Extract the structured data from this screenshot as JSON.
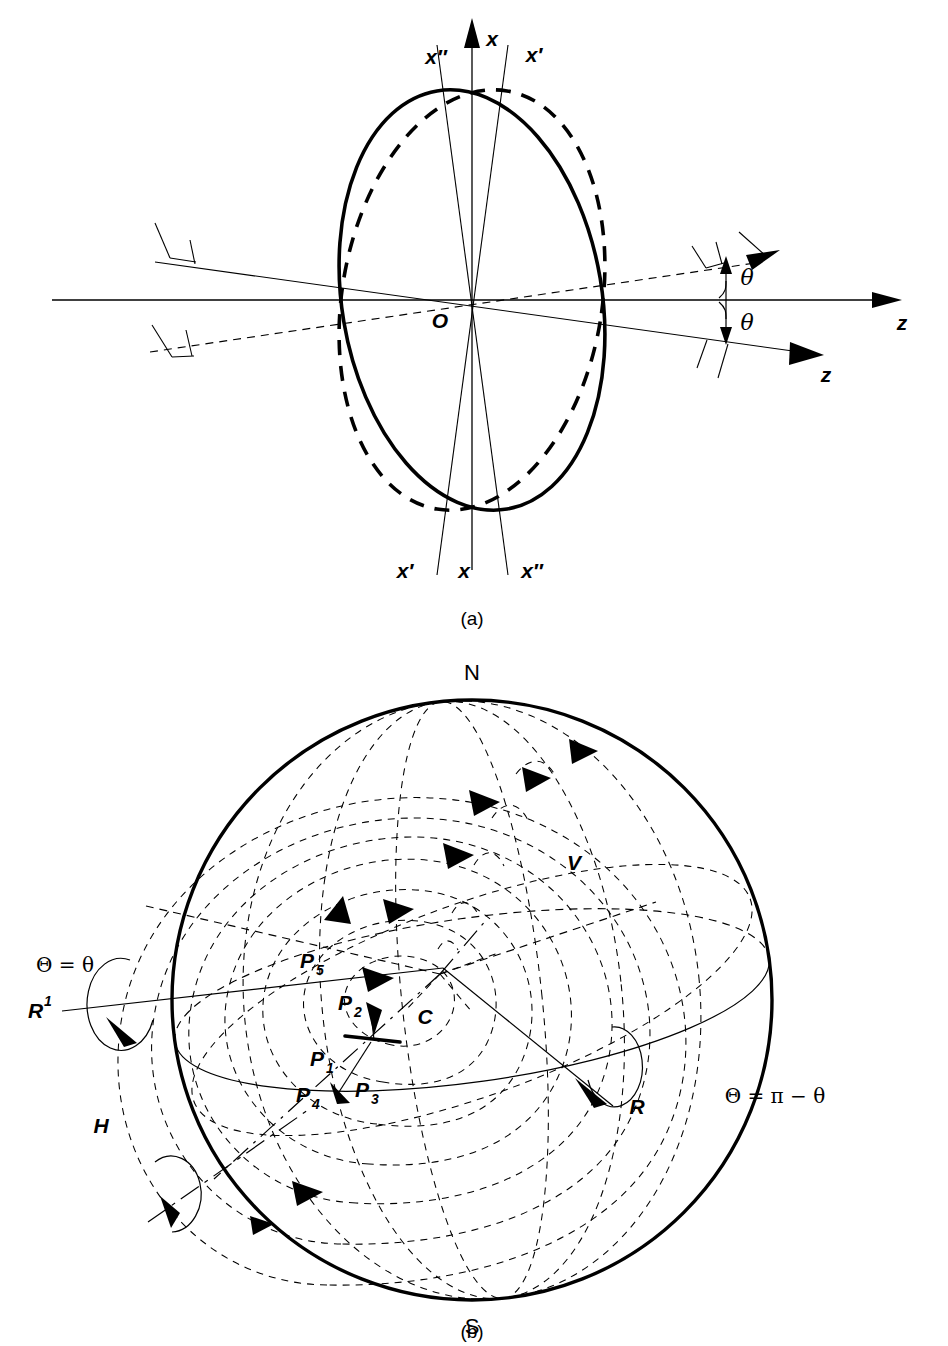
{
  "figure": {
    "background_color": "#ffffff",
    "ink_color": "#000000",
    "panels": [
      {
        "id": "a",
        "caption": "(a)",
        "description": "Two tilted ellipses (solid and dashed) about origin O with rotated coordinate axes",
        "axis_labels_top": [
          "x″",
          "x",
          "x′"
        ],
        "axis_labels_bottom": [
          "x′",
          "x",
          "x″"
        ],
        "origin_label": "O",
        "z_axis_label": "z",
        "z_tilted_label": "z",
        "angle_labels": [
          "θ",
          "θ"
        ]
      },
      {
        "id": "b",
        "caption": "(b)",
        "description": "Sphere with north/south poles, dashed flow contours, rotation vectors and point markers",
        "pole_north": "N",
        "pole_south": "S",
        "center_label": "C",
        "velocity_label": "V",
        "rotation_label_right": "R",
        "rotation_label_left": "R¹",
        "axis_label_h": "H",
        "theta_left": "Θ = θ",
        "theta_right": "Θ = π − θ",
        "point_labels": [
          "P₁",
          "P₂",
          "P₃",
          "P₄",
          "P₅"
        ],
        "point_label_bases": [
          "P",
          "P",
          "P",
          "P",
          "P"
        ],
        "point_label_subs": [
          "1",
          "2",
          "3",
          "4",
          "5"
        ]
      }
    ]
  },
  "panel_a": {
    "caption": "(a)",
    "label_x_top_left": "x″",
    "label_x_top_center": "x",
    "label_x_top_right": "x′",
    "label_x_bottom_left": "x′",
    "label_x_bottom_center": "x",
    "label_x_bottom_right": "x″",
    "label_origin": "O",
    "label_z_horizontal": "z",
    "label_z_tilted": "z",
    "label_theta_upper": "θ",
    "label_theta_lower": "θ"
  },
  "panel_b": {
    "caption": "(b)",
    "label_n": "N",
    "label_s": "S",
    "label_c": "C",
    "label_v": "V",
    "label_r": "R",
    "label_r1_base": "R",
    "label_r1_sup": "1",
    "label_h": "H",
    "label_theta_left": "Θ = θ",
    "label_theta_right": "Θ = π − θ",
    "label_p1_base": "P",
    "label_p1_sub": "1",
    "label_p2_base": "P",
    "label_p2_sub": "2",
    "label_p3_base": "P",
    "label_p3_sub": "3",
    "label_p4_base": "P",
    "label_p4_sub": "4",
    "label_p5_base": "P",
    "label_p5_sub": "5"
  }
}
